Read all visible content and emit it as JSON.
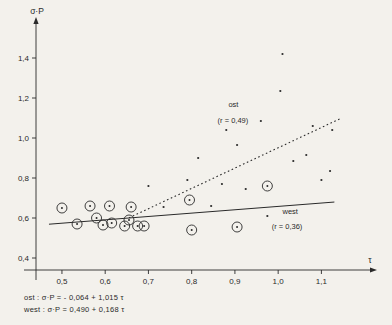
{
  "chart_data": {
    "type": "scatter",
    "title": "",
    "ylabel": "σ·P",
    "xlabel": "τ",
    "xlim": [
      0.44,
      1.18
    ],
    "ylim": [
      0.34,
      1.5
    ],
    "grid": false,
    "xticks": [
      "0,5",
      "0,6",
      "0,7",
      "0,8",
      "0,9",
      "1,0",
      "1,1"
    ],
    "xtickvals": [
      0.5,
      0.6,
      0.7,
      0.8,
      0.9,
      1.0,
      1.1
    ],
    "yticks": [
      "0,4",
      "0,6",
      "0,8",
      "1,0",
      "1,2",
      "1,4"
    ],
    "ytickvals": [
      0.4,
      0.6,
      0.8,
      1.0,
      1.2,
      1.4
    ],
    "series": [
      {
        "name": "west",
        "marker": "circled-dot",
        "r_label": "(r = 0,36)",
        "legend_label": "west",
        "points": [
          [
            0.5,
            0.65
          ],
          [
            0.535,
            0.57
          ],
          [
            0.565,
            0.66
          ],
          [
            0.58,
            0.6
          ],
          [
            0.595,
            0.565
          ],
          [
            0.61,
            0.66
          ],
          [
            0.615,
            0.575
          ],
          [
            0.645,
            0.56
          ],
          [
            0.655,
            0.59
          ],
          [
            0.66,
            0.655
          ],
          [
            0.675,
            0.56
          ],
          [
            0.69,
            0.56
          ],
          [
            0.795,
            0.69
          ],
          [
            0.8,
            0.54
          ],
          [
            0.905,
            0.555
          ],
          [
            0.975,
            0.76
          ]
        ]
      },
      {
        "name": "ost",
        "marker": "dot",
        "r_label": "(r = 0,49)",
        "legend_label": "ost",
        "points": [
          [
            0.7,
            0.76
          ],
          [
            0.735,
            0.655
          ],
          [
            0.79,
            0.79
          ],
          [
            0.815,
            0.9
          ],
          [
            0.845,
            0.66
          ],
          [
            0.87,
            0.77
          ],
          [
            0.88,
            1.04
          ],
          [
            0.905,
            0.965
          ],
          [
            0.925,
            0.745
          ],
          [
            0.96,
            1.085
          ],
          [
            0.975,
            0.61
          ],
          [
            1.005,
            1.235
          ],
          [
            1.01,
            1.42
          ],
          [
            1.035,
            0.885
          ],
          [
            1.065,
            0.915
          ],
          [
            1.08,
            1.06
          ],
          [
            1.1,
            0.79
          ],
          [
            1.12,
            0.835
          ],
          [
            1.125,
            1.04
          ]
        ]
      }
    ],
    "fits": [
      {
        "name": "ost",
        "style": "dotted",
        "intercept": -0.064,
        "slope": 1.015,
        "x_from": 0.655,
        "x_to": 1.145,
        "equation": "ost : σ·P = - 0,064 + 1,015  τ"
      },
      {
        "name": "west",
        "style": "solid",
        "intercept": 0.49,
        "slope": 0.168,
        "x_from": 0.47,
        "x_to": 1.13,
        "equation": "west : σ·P =   0,490 + 0,168  τ"
      }
    ],
    "annotations": [
      {
        "name": "ost-label",
        "text": "ost",
        "x": 0.885,
        "y": 1.155
      },
      {
        "name": "ost-r-label",
        "text": "(r = 0,49)",
        "x": 0.86,
        "y": 1.075
      },
      {
        "name": "west-label",
        "text": "west",
        "x": 1.01,
        "y": 0.62
      },
      {
        "name": "west-r-label",
        "text": "(r = 0,36)",
        "x": 0.985,
        "y": 0.545
      }
    ],
    "axis_arrow_labels": {
      "y": "σ·P",
      "x": "τ"
    },
    "footer_equations": [
      "ost  : σ·P = - 0,064 + 1,015  τ",
      "west : σ·P =   0,490 + 0,168  τ"
    ],
    "colors": {
      "ink": "#2a2a2a",
      "background": "#f3f1ec"
    }
  }
}
